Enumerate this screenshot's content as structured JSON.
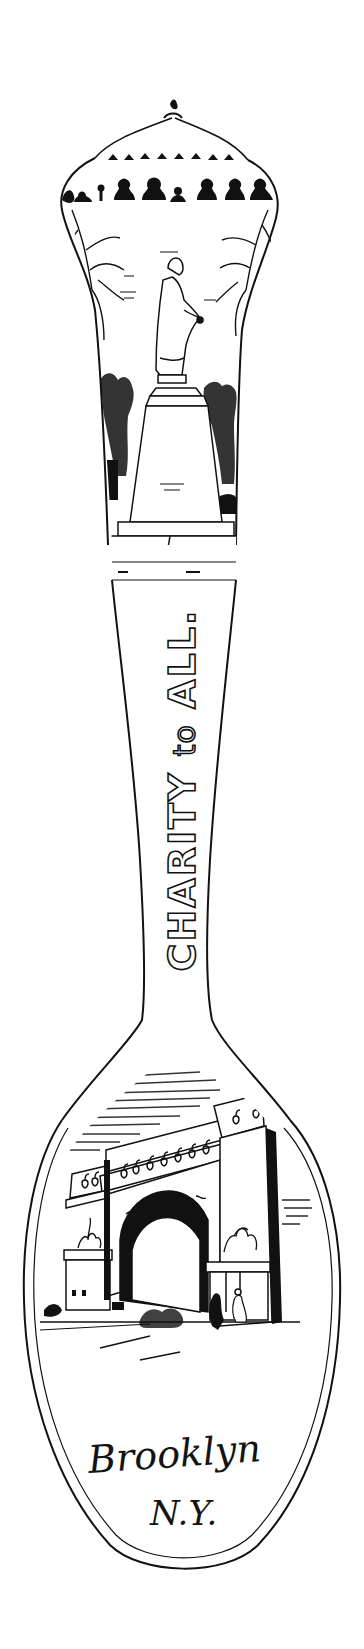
{
  "image": {
    "subject": "Engraved souvenir spoon line drawing",
    "colors": {
      "background": "#ffffff",
      "ink": "#111111"
    }
  },
  "finial": {
    "description": "Domed finial with row of portrait busts"
  },
  "handle_top_scene": {
    "description": "Standing statue on tall pedestal flanked by trees"
  },
  "handle": {
    "inscription_main": "CHARITY",
    "inscription_mid": "to",
    "inscription_end": "ALL."
  },
  "bowl": {
    "scene_description": "Triumphal memorial arch with colonnade and figures",
    "city": "Brooklyn",
    "state": "N.Y."
  }
}
